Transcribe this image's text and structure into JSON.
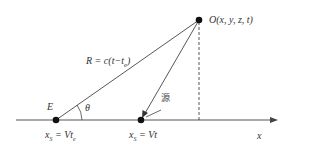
{
  "diagram": {
    "points": {
      "emission": {
        "label": "E",
        "position_label": "x_S = Vt_e"
      },
      "source": {
        "label_position": "x_S = Vt",
        "annotation": "源"
      },
      "observer": {
        "label": "O(x, y, z, t)"
      }
    },
    "segments": {
      "distance": {
        "label": "R = c(t−t_e)"
      }
    },
    "angle": {
      "label": "θ"
    },
    "axis": {
      "label": "x"
    },
    "labels": {
      "observer": "O(x, y, z, t)",
      "distance": "R = c(t−t",
      "distance_sub": "e",
      "distance_close": ")",
      "E": "E",
      "theta": "θ",
      "source_char": "源",
      "xs1_main": "x",
      "xs1_sub": "S",
      "xs1_eq": " = Vt",
      "xs1_sub2": "e",
      "xs2_main": "x",
      "xs2_sub": "S",
      "xs2_eq": " = Vt",
      "x_axis": "x"
    },
    "colors": {
      "line": "#333333",
      "dot": "#111111",
      "text": "#333333"
    }
  }
}
